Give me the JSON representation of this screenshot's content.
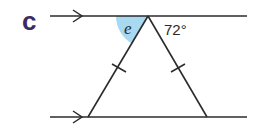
{
  "diagram": {
    "part_label": "c",
    "angle_unknown_label": "e",
    "angle_known_label": "72°",
    "angle_known_value_deg": 72,
    "colors": {
      "line": "#2b2b2b",
      "shade": "#a9d8f1",
      "label_c": "#3b2a63"
    }
  }
}
